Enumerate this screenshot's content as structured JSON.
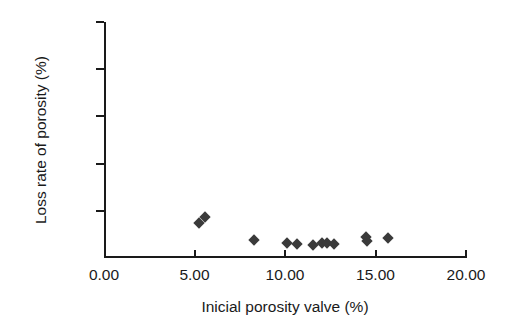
{
  "chart_data": {
    "type": "scatter",
    "title": "",
    "xlabel": "Inicial porosity valve (%)",
    "ylabel": "Loss rate of porosity (%)",
    "xlim": [
      0,
      20
    ],
    "ylim": [
      0,
      100
    ],
    "xticks": [
      0,
      5,
      10,
      15,
      20
    ],
    "xticklabels": [
      "0.00",
      "5.00",
      "10.00",
      "15.00",
      "20.00"
    ],
    "yticks": [
      0,
      20,
      40,
      60,
      80,
      100
    ],
    "yticklabels": [
      "0",
      "20",
      "40",
      "60",
      "80",
      "100"
    ],
    "grid": false,
    "legend": null,
    "marker_shape": "diamond",
    "marker_color": "#3a3a3a",
    "series": [
      {
        "name": "samples",
        "points": [
          {
            "x": 5.15,
            "y": 15.0
          },
          {
            "x": 5.45,
            "y": 17.5
          },
          {
            "x": 8.15,
            "y": 7.5
          },
          {
            "x": 10.0,
            "y": 6.5
          },
          {
            "x": 10.55,
            "y": 6.0
          },
          {
            "x": 11.45,
            "y": 5.5
          },
          {
            "x": 11.95,
            "y": 6.5
          },
          {
            "x": 12.2,
            "y": 6.5
          },
          {
            "x": 12.6,
            "y": 6.0
          },
          {
            "x": 14.35,
            "y": 9.0
          },
          {
            "x": 14.4,
            "y": 7.0
          },
          {
            "x": 15.6,
            "y": 8.5
          }
        ]
      }
    ]
  },
  "axes": {
    "colors": {
      "axis": "#1a1a1a",
      "background": "#ffffff",
      "marker": "#3a3a3a"
    }
  }
}
